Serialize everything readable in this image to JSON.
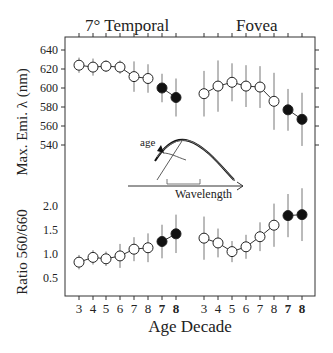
{
  "chart_data": [
    {
      "type": "line",
      "panel": "top",
      "ylabel": "Max. Emi. λ (nm)",
      "yticks": [
        540,
        560,
        580,
        600,
        620,
        640
      ],
      "ylim": [
        535,
        645
      ],
      "groups": [
        {
          "title": "7° Temporal",
          "x": [
            "3",
            "4",
            "5",
            "6",
            "7",
            "8",
            "7",
            "8"
          ],
          "series": [
            {
              "name": "normal (open)",
              "x": [
                "3",
                "4",
                "5",
                "6",
                "7",
                "8"
              ],
              "values": [
                624,
                622,
                623,
                622,
                612,
                610
              ],
              "err": [
                8,
                9,
                6,
                7,
                16,
                15
              ]
            },
            {
              "name": "bold (filled)",
              "x": [
                "7",
                "8"
              ],
              "values": [
                600,
                590
              ],
              "err": [
                15,
                20
              ]
            }
          ]
        },
        {
          "title": "Fovea",
          "x": [
            "3",
            "4",
            "5",
            "6",
            "7",
            "8",
            "7",
            "8"
          ],
          "series": [
            {
              "name": "normal (open)",
              "x": [
                "3",
                "4",
                "5",
                "6",
                "7",
                "8"
              ],
              "values": [
                594,
                602,
                606,
                602,
                601,
                586
              ],
              "err": [
                24,
                27,
                20,
                22,
                22,
                30
              ]
            },
            {
              "name": "bold (filled)",
              "x": [
                "7",
                "8"
              ],
              "values": [
                577,
                567
              ],
              "err": [
                22,
                28
              ]
            }
          ]
        }
      ]
    },
    {
      "type": "line",
      "panel": "bottom",
      "ylabel": "Ratio 560/660",
      "xlabel": "Age Decade",
      "yticks": [
        0.5,
        1.0,
        1.5,
        2.0
      ],
      "ylim": [
        0.25,
        2.2
      ],
      "groups": [
        {
          "title": "7° Temporal",
          "series": [
            {
              "name": "normal (open)",
              "x": [
                "3",
                "4",
                "5",
                "6",
                "7",
                "8"
              ],
              "values": [
                0.83,
                0.93,
                0.9,
                0.96,
                1.1,
                1.13
              ],
              "err": [
                0.15,
                0.15,
                0.15,
                0.25,
                0.25,
                0.3
              ]
            },
            {
              "name": "bold (filled)",
              "x": [
                "7",
                "8"
              ],
              "values": [
                1.26,
                1.42
              ],
              "err": [
                0.35,
                0.4
              ]
            }
          ]
        },
        {
          "title": "Fovea",
          "series": [
            {
              "name": "normal (open)",
              "x": [
                "3",
                "4",
                "5",
                "6",
                "7",
                "8"
              ],
              "values": [
                1.33,
                1.23,
                1.05,
                1.15,
                1.36,
                1.6
              ],
              "err": [
                0.45,
                0.3,
                0.22,
                0.25,
                0.3,
                0.45
              ]
            },
            {
              "name": "bold (filled)",
              "x": [
                "7",
                "8"
              ],
              "values": [
                1.8,
                1.82
              ],
              "err": [
                0.45,
                0.55
              ]
            }
          ]
        }
      ]
    }
  ],
  "labels": {
    "title_left": "7° Temporal",
    "title_right": "Fovea",
    "ylabel_top": "Max. Emi. λ (nm)",
    "ylabel_bottom": "Ratio 560/660",
    "xlabel": "Age Decade",
    "inset_age": "age",
    "inset_wavelength": "Wavelength",
    "yticks_top": [
      "640",
      "620",
      "600",
      "580",
      "560",
      "540"
    ],
    "yticks_bottom": [
      "2.0",
      "1.5",
      "1.0",
      "0.5"
    ],
    "xticks": [
      "3",
      "4",
      "5",
      "6",
      "7",
      "8",
      "7",
      "8",
      "3",
      "4",
      "5",
      "6",
      "7",
      "8",
      "7",
      "8"
    ]
  }
}
